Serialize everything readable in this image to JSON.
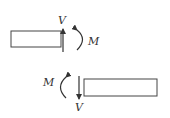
{
  "diagram": {
    "top": {
      "shear_label": "V",
      "moment_label": "M"
    },
    "bottom": {
      "shear_label": "V",
      "moment_label": "M"
    },
    "colors": {
      "stroke": "#333333",
      "background": "#ffffff"
    }
  }
}
